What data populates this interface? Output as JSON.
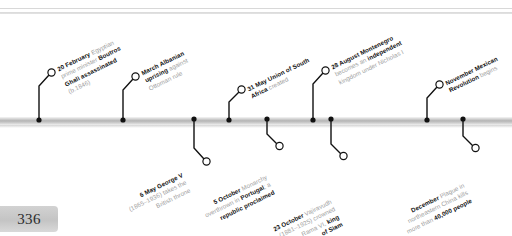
{
  "page": {
    "number": "336",
    "year_context": "1910"
  },
  "timeline": {
    "bar_color": "#b4b4b4",
    "accent_color": "#111111",
    "dim_color": "#9d9d9d"
  },
  "events": [
    {
      "id": "boutros-ghali-assassinated",
      "side": "above",
      "date": "20 February",
      "lines": [
        {
          "parts": [
            {
              "t": "20 February",
              "b": true
            },
            {
              "t": " Egyptian",
              "b": false
            }
          ]
        },
        {
          "parts": [
            {
              "t": "prime minister ",
              "b": false
            },
            {
              "t": "Boutros",
              "b": true
            }
          ]
        },
        {
          "parts": [
            {
              "t": "Ghali assassinated",
              "b": true
            }
          ]
        },
        {
          "parts": [
            {
              "t": "(b.1846)",
              "b": false
            }
          ]
        }
      ],
      "plain": "20 February Egyptian prime minister Boutros Ghali assassinated (b.1846)"
    },
    {
      "id": "albanian-uprising",
      "side": "above",
      "date": "March",
      "lines": [
        {
          "parts": [
            {
              "t": "March Albanian",
              "b": true
            }
          ]
        },
        {
          "parts": [
            {
              "t": "uprising",
              "b": true
            },
            {
              "t": " against",
              "b": false
            }
          ]
        },
        {
          "parts": [
            {
              "t": "Ottoman rule",
              "b": false
            }
          ]
        }
      ],
      "plain": "March Albanian uprising against Ottoman rule"
    },
    {
      "id": "union-of-south-africa",
      "side": "above",
      "date": "31 May",
      "lines": [
        {
          "parts": [
            {
              "t": "31 May",
              "b": true
            },
            {
              "t": " ",
              "b": false
            },
            {
              "t": "Union of South",
              "b": true
            }
          ]
        },
        {
          "parts": [
            {
              "t": "Africa ",
              "b": true
            },
            {
              "t": "created",
              "b": false
            }
          ]
        }
      ],
      "plain": "31 May Union of South Africa created"
    },
    {
      "id": "montenegro-kingdom",
      "side": "above",
      "date": "28 August",
      "lines": [
        {
          "parts": [
            {
              "t": "28 August Montenegro",
              "b": true
            }
          ]
        },
        {
          "parts": [
            {
              "t": "becomes an ",
              "b": false
            },
            {
              "t": "independent",
              "b": true
            }
          ]
        },
        {
          "parts": [
            {
              "t": "kingdom under Nicholas I",
              "b": false
            }
          ]
        }
      ],
      "plain": "28 August Montenegro becomes an independent kingdom under Nicholas I"
    },
    {
      "id": "mexican-revolution",
      "side": "above",
      "date": "November",
      "lines": [
        {
          "parts": [
            {
              "t": "November Mexican",
              "b": true
            }
          ]
        },
        {
          "parts": [
            {
              "t": "Revolution ",
              "b": true
            },
            {
              "t": "begins",
              "b": false
            }
          ]
        }
      ],
      "plain": "November Mexican Revolution begins"
    },
    {
      "id": "george-v-throne",
      "side": "below",
      "date": "6 May",
      "lines": [
        {
          "parts": [
            {
              "t": "6 May George V",
              "b": true
            }
          ]
        },
        {
          "parts": [
            {
              "t": "(1865–1936) takes the",
              "b": false
            }
          ]
        },
        {
          "parts": [
            {
              "t": "British throne",
              "b": false
            }
          ]
        }
      ],
      "plain": "6 May George V (1865–1936) takes the British throne"
    },
    {
      "id": "portugal-republic",
      "side": "below",
      "date": "5 October",
      "lines": [
        {
          "parts": [
            {
              "t": "5 October",
              "b": true
            },
            {
              "t": " Monarchy",
              "b": false
            }
          ]
        },
        {
          "parts": [
            {
              "t": "overthrown in ",
              "b": false
            },
            {
              "t": "Portugal",
              "b": true
            },
            {
              "t": "; a",
              "b": false
            }
          ]
        },
        {
          "parts": [
            {
              "t": "republic proclaimed",
              "b": true
            }
          ]
        }
      ],
      "plain": "5 October Monarchy overthrown in Portugal; a republic proclaimed"
    },
    {
      "id": "rama-vi-siam",
      "side": "below",
      "date": "23 October",
      "lines": [
        {
          "parts": [
            {
              "t": "23 October",
              "b": true
            },
            {
              "t": " Vajiravudh",
              "b": false
            }
          ]
        },
        {
          "parts": [
            {
              "t": "(1881–1925) crowned",
              "b": false
            }
          ]
        },
        {
          "parts": [
            {
              "t": "Rama VI, ",
              "b": false
            },
            {
              "t": "king",
              "b": true
            }
          ]
        },
        {
          "parts": [
            {
              "t": "of Siam",
              "b": true
            }
          ]
        }
      ],
      "plain": "23 October Vajiravudh (1881–1925) crowned Rama VI, king of Siam"
    },
    {
      "id": "manchurian-plague",
      "side": "below",
      "date": "December",
      "lines": [
        {
          "parts": [
            {
              "t": "December",
              "b": true
            },
            {
              "t": " Plague in",
              "b": false
            }
          ]
        },
        {
          "parts": [
            {
              "t": "northeastern China kills",
              "b": false
            }
          ]
        },
        {
          "parts": [
            {
              "t": "more than ",
              "b": false
            },
            {
              "t": "40,000 people",
              "b": true
            }
          ]
        }
      ],
      "plain": "December Plague in northeastern China kills more than 40,000 people"
    }
  ],
  "marker_dots": {
    "above_x": [
      38,
      122,
      228,
      312,
      426
    ],
    "below_x": [
      193,
      266,
      330,
      462
    ]
  }
}
